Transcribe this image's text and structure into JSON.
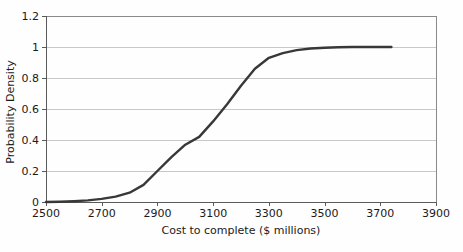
{
  "chart_data": {
    "type": "line",
    "title": "",
    "xlabel": "Cost to complete ($ millions)",
    "ylabel": "Probability Density",
    "xlim": [
      2500,
      3900
    ],
    "ylim": [
      0,
      1.2
    ],
    "x_ticks": [
      2500,
      2700,
      2900,
      3100,
      3300,
      3500,
      3700,
      3900
    ],
    "x_tick_labels": [
      "2500",
      "2700",
      "2900",
      "3100",
      "3300",
      "3500",
      "3700",
      "3900"
    ],
    "y_ticks": [
      0,
      0.2,
      0.4,
      0.6,
      0.8,
      1,
      1.2
    ],
    "y_tick_labels": [
      "0",
      "0.2",
      "0.4",
      "0.6",
      "0.8",
      "1",
      "1.2"
    ],
    "grid": "horizontal",
    "legend": "none",
    "series": [
      {
        "points": [
          [
            2500,
            0
          ],
          [
            2550,
            0.002
          ],
          [
            2600,
            0.005
          ],
          [
            2650,
            0.01
          ],
          [
            2700,
            0.02
          ],
          [
            2750,
            0.035
          ],
          [
            2800,
            0.06
          ],
          [
            2850,
            0.11
          ],
          [
            2900,
            0.2
          ],
          [
            2950,
            0.29
          ],
          [
            3000,
            0.37
          ],
          [
            3050,
            0.42
          ],
          [
            3100,
            0.52
          ],
          [
            3150,
            0.63
          ],
          [
            3200,
            0.75
          ],
          [
            3250,
            0.86
          ],
          [
            3300,
            0.93
          ],
          [
            3350,
            0.96
          ],
          [
            3400,
            0.98
          ],
          [
            3450,
            0.99
          ],
          [
            3500,
            0.995
          ],
          [
            3550,
            0.998
          ],
          [
            3600,
            1.0
          ],
          [
            3650,
            1.0
          ],
          [
            3700,
            1.0
          ],
          [
            3740,
            1.0
          ]
        ]
      }
    ],
    "colors": {
      "line": "#383838",
      "gridline": "#c8c8c8",
      "border": "#8a8a8a",
      "axis": "#5a5a5a",
      "text": "#1a1a1a",
      "background": "#fefefe"
    }
  }
}
